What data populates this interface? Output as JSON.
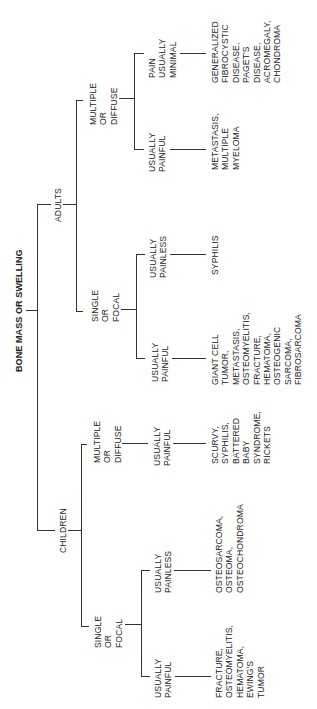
{
  "diagram": {
    "title": "BONE MASS OR SWELLING",
    "orientation": "rotated 90deg counter-clockwise",
    "root": {
      "label": "BONE MASS OR SWELLING",
      "children": [
        {
          "label": "ADULTS",
          "children": [
            {
              "label": "MULTIPLE\nOR\nDIFFUSE",
              "children": [
                {
                  "label": "PAIN\nUSUALLY\nMINIMAL",
                  "leaf": "GENERALIZED\nFIBROCYSTIC\nDISEASE,\nPAGET'S\nDISEASE,\nACROMEGALY,\nCHONDROMA"
                },
                {
                  "label": "USUALLY\nPAINFUL",
                  "leaf": "METASTASIS,\nMULTIPLE\nMYELOMA"
                }
              ]
            },
            {
              "label": "SINGLE\nOR\nFOCAL",
              "children": [
                {
                  "label": "USUALLY\nPAINLESS",
                  "leaf": "SYPHILIS"
                },
                {
                  "label": "USUALLY\nPAINFUL",
                  "leaf": "GIANT CELL\nTUMOR,\nMETASTASIS,\nOSTEOMYELITIS,\nFRACTURE,\nHEMATOMA,\nOSTEOGENIC\nSARCOMA,\nFIBROSARCOMA"
                }
              ]
            }
          ]
        },
        {
          "label": "CHILDREN",
          "children": [
            {
              "label": "MULTIPLE\nOR\nDIFFUSE",
              "children": [
                {
                  "label": "USUALLY\nPAINFUL",
                  "leaf": "SCURVY,\nSYPHILIS,\nBATTERED\nBABY\nSYNDROME,\nRICKETS"
                }
              ]
            },
            {
              "label": "SINGLE\nOR\nFOCAL",
              "children": [
                {
                  "label": "USUALLY\nPAINLESS",
                  "leaf": "OSTEOSARCOMA,\nOSTEOMA,\nOSTEOCHONDROMA"
                },
                {
                  "label": "USUALLY\nPAINFUL",
                  "leaf": "FRACTURE,\nOSTEOMYELITIS,\nHEMATOMA,\nEWING'S\nTUMOR"
                }
              ]
            }
          ]
        }
      ]
    }
  },
  "labels": {
    "title": "BONE MASS OR SWELLING",
    "adults": "ADULTS",
    "children": "CHILDREN",
    "a_multi": "MULTIPLE\nOR\nDIFFUSE",
    "a_multi_minimal": "PAIN\nUSUALLY\nMINIMAL",
    "a_multi_minimal_leaf": "GENERALIZED\nFIBROCYSTIC\nDISEASE,\nPAGET'S\nDISEASE,\nACROMEGALY,\nCHONDROMA",
    "a_multi_painful": "USUALLY\nPAINFUL",
    "a_multi_painful_leaf": "METASTASIS,\nMULTIPLE\nMYELOMA",
    "a_single": "SINGLE\nOR\nFOCAL",
    "a_single_painless": "USUALLY\nPAINLESS",
    "a_single_painless_leaf": "SYPHILIS",
    "a_single_painful": "USUALLY\nPAINFUL",
    "a_single_painful_leaf": "GIANT CELL\nTUMOR,\nMETASTASIS,\nOSTEOMYELITIS,\nFRACTURE,\nHEMATOMA,\nOSTEOGENIC\nSARCOMA,\nFIBROSARCOMA",
    "c_multi": "MULTIPLE\nOR\nDIFFUSE",
    "c_multi_painful": "USUALLY\nPAINFUL",
    "c_multi_painful_leaf": "SCURVY,\nSYPHILIS,\nBATTERED\nBABY\nSYNDROME,\nRICKETS",
    "c_single": "SINGLE\nOR\nFOCAL",
    "c_single_painless": "USUALLY\nPAINLESS",
    "c_single_painless_leaf": "OSTEOSARCOMA,\nOSTEOMA,\nOSTEOCHONDROMA",
    "c_single_painful": "USUALLY\nPAINFUL",
    "c_single_painful_leaf": "FRACTURE,\nOSTEOMYELITIS,\nHEMATOMA,\nEWING'S\nTUMOR"
  },
  "colors": {
    "line": "#333333",
    "text": "#222222",
    "background": "#ffffff"
  }
}
